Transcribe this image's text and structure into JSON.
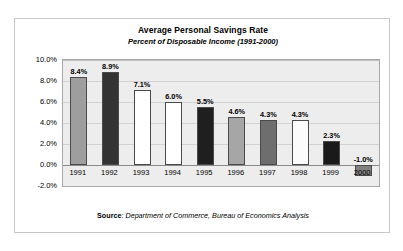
{
  "chart_data": {
    "type": "bar",
    "title": "Average Personal Savings Rate",
    "subtitle": "Percent of Disposable Income (1991-2000)",
    "xlabel": "",
    "ylabel": "",
    "ylim": [
      -2.0,
      10.0
    ],
    "ytick_step": 2.0,
    "grid": true,
    "legend": "none",
    "categories": [
      "1991",
      "1992",
      "1993",
      "1994",
      "1995",
      "1996",
      "1997",
      "1998",
      "1999",
      "2000"
    ],
    "values": [
      8.4,
      8.9,
      7.1,
      6.0,
      5.5,
      4.6,
      4.3,
      4.3,
      2.3,
      -1.0
    ],
    "value_labels": [
      "8.4%",
      "8.9%",
      "7.1%",
      "6.0%",
      "5.5%",
      "4.6%",
      "4.3%",
      "4.3%",
      "2.3%",
      "-1.0%"
    ],
    "bar_colors": [
      "#9e9e9e",
      "#333333",
      "#ffffff",
      "#ffffff",
      "#1f1f1f",
      "#a6a6a6",
      "#6e6e6e",
      "#fbfbfb",
      "#1a1a1a",
      "#808080"
    ],
    "ytick_labels": [
      "10.0%",
      "8.0%",
      "6.0%",
      "4.0%",
      "2.0%",
      "0.0%",
      "-2.0%"
    ],
    "ytick_values": [
      10.0,
      8.0,
      6.0,
      4.0,
      2.0,
      0.0,
      -2.0
    ],
    "plot_background": "#ededed",
    "gridline_color": "#d2d2d2",
    "bar_border_color": "#4a4a4a"
  },
  "source": {
    "label": "Source",
    "separator": ": ",
    "text": "Department of Commerce, Bureau of Economics Analysis"
  }
}
